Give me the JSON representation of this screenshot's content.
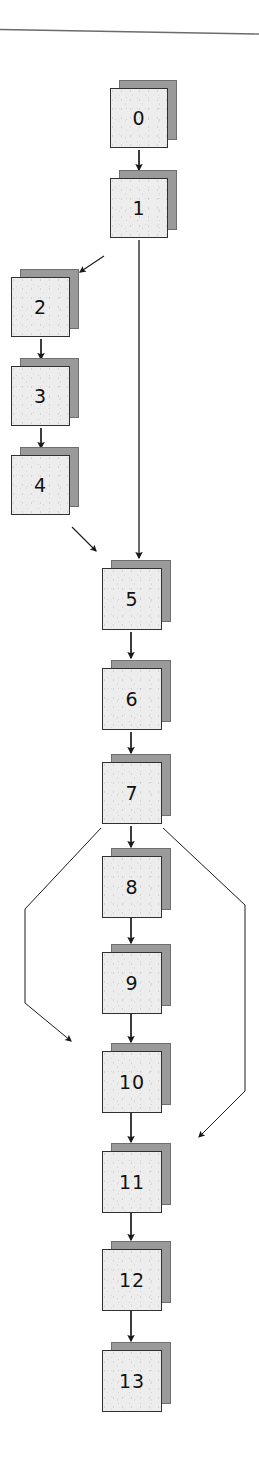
{
  "document": {
    "type": "flowchart",
    "title": "Process flow diagram",
    "description": "Scanned flowchart of stacked-document nodes numbered 0 through 13"
  },
  "colors": {
    "page_background": "#ffffff",
    "node_face": "#ededed",
    "node_border": "#303030",
    "node_shadow": "#9a9a9a",
    "node_shadow_border": "#6f6f6f",
    "edge": "#1a1a1a",
    "label": "#111111",
    "scan_line": "#6b6b6b"
  },
  "nodes": [
    {
      "id": "n0",
      "label": "0",
      "x": 110,
      "y": 88,
      "w": 58,
      "h": 60
    },
    {
      "id": "n1",
      "label": "1",
      "x": 110,
      "y": 178,
      "w": 58,
      "h": 60
    },
    {
      "id": "n2",
      "label": "2",
      "x": 11,
      "y": 277,
      "w": 59,
      "h": 60
    },
    {
      "id": "n3",
      "label": "3",
      "x": 11,
      "y": 366,
      "w": 59,
      "h": 60
    },
    {
      "id": "n4",
      "label": "4",
      "x": 11,
      "y": 455,
      "w": 59,
      "h": 60
    },
    {
      "id": "n5",
      "label": "5",
      "x": 102,
      "y": 568,
      "w": 60,
      "h": 62
    },
    {
      "id": "n6",
      "label": "6",
      "x": 102,
      "y": 668,
      "w": 60,
      "h": 62
    },
    {
      "id": "n7",
      "label": "7",
      "x": 102,
      "y": 762,
      "w": 60,
      "h": 62
    },
    {
      "id": "n8",
      "label": "8",
      "x": 102,
      "y": 856,
      "w": 60,
      "h": 62
    },
    {
      "id": "n9",
      "label": "9",
      "x": 102,
      "y": 952,
      "w": 60,
      "h": 62
    },
    {
      "id": "n10",
      "label": "10",
      "x": 102,
      "y": 1051,
      "w": 60,
      "h": 62
    },
    {
      "id": "n11",
      "label": "11",
      "x": 102,
      "y": 1151,
      "w": 60,
      "h": 62
    },
    {
      "id": "n12",
      "label": "12",
      "x": 102,
      "y": 1249,
      "w": 60,
      "h": 62
    },
    {
      "id": "n13",
      "label": "13",
      "x": 102,
      "y": 1350,
      "w": 60,
      "h": 62
    }
  ],
  "edges": [
    {
      "id": "e0_1",
      "from": "0",
      "to": "1",
      "kind": "straight-down"
    },
    {
      "id": "e1_2",
      "from": "1",
      "to": "2",
      "kind": "diagonal-left"
    },
    {
      "id": "e1_5",
      "from": "1",
      "to": "5",
      "kind": "long-straight-down"
    },
    {
      "id": "e2_3",
      "from": "2",
      "to": "3",
      "kind": "straight-down"
    },
    {
      "id": "e3_4",
      "from": "3",
      "to": "4",
      "kind": "straight-down"
    },
    {
      "id": "e4_5",
      "from": "4",
      "to": "5",
      "kind": "diagonal-right"
    },
    {
      "id": "e5_6",
      "from": "5",
      "to": "6",
      "kind": "straight-down"
    },
    {
      "id": "e6_7",
      "from": "6",
      "to": "7",
      "kind": "straight-down"
    },
    {
      "id": "e7_8",
      "from": "7",
      "to": "8",
      "kind": "straight-down"
    },
    {
      "id": "e7_10",
      "from": "7",
      "to": "10",
      "kind": "bypass-left"
    },
    {
      "id": "e7_11",
      "from": "7",
      "to": "11",
      "kind": "bypass-right"
    },
    {
      "id": "e8_9",
      "from": "8",
      "to": "9",
      "kind": "straight-down"
    },
    {
      "id": "e9_10",
      "from": "9",
      "to": "10",
      "kind": "straight-down"
    },
    {
      "id": "e10_11",
      "from": "10",
      "to": "11",
      "kind": "straight-down"
    },
    {
      "id": "e11_12",
      "from": "11",
      "to": "12",
      "kind": "straight-down"
    },
    {
      "id": "e12_13",
      "from": "12",
      "to": "13",
      "kind": "straight-down"
    }
  ],
  "artifacts": {
    "top_rule": {
      "present": true,
      "y_left": 29,
      "y_right": 34
    }
  }
}
